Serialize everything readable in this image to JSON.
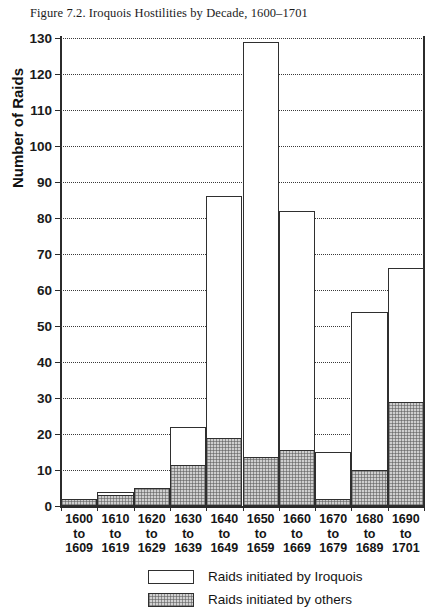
{
  "chart_data": {
    "type": "bar",
    "title": "Figure 7.2. Iroquois Hostilities by Decade, 1600–1701",
    "xlabel": "",
    "ylabel": "Number of Raids",
    "ylim": [
      0,
      130
    ],
    "ytick_step": 10,
    "grid": true,
    "stacked": true,
    "legend_position": "bottom",
    "categories": [
      "1600 to 1609",
      "1610 to 1619",
      "1620 to 1629",
      "1630 to 1639",
      "1640 to 1649",
      "1650 to 1659",
      "1660 to 1669",
      "1670 to 1679",
      "1680 to 1689",
      "1690 to 1701"
    ],
    "category_lines": [
      [
        "1600",
        "to",
        "1609"
      ],
      [
        "1610",
        "to",
        "1619"
      ],
      [
        "1620",
        "to",
        "1629"
      ],
      [
        "1630",
        "to",
        "1639"
      ],
      [
        "1640",
        "to",
        "1649"
      ],
      [
        "1650",
        "to",
        "1659"
      ],
      [
        "1660",
        "to",
        "1669"
      ],
      [
        "1670",
        "to",
        "1679"
      ],
      [
        "1680",
        "to",
        "1689"
      ],
      [
        "1690",
        "to",
        "1701"
      ]
    ],
    "yticks": [
      0,
      10,
      20,
      30,
      40,
      50,
      60,
      70,
      80,
      90,
      100,
      110,
      120,
      130
    ],
    "series": [
      {
        "name": "Raids initiated by Iroquois",
        "swatch": "open",
        "values": [
          0,
          1,
          0,
          10.5,
          67,
          115.5,
          66.5,
          13,
          44,
          37
        ]
      },
      {
        "name": "Raids initiated by others",
        "swatch": "shaded",
        "values": [
          2,
          3,
          5,
          11.5,
          19,
          13.5,
          15.5,
          2,
          10,
          29
        ]
      }
    ],
    "totals": [
      2,
      4,
      5,
      22,
      86,
      129,
      82,
      15,
      54,
      66
    ]
  },
  "legend": {
    "items": [
      {
        "label": "Raids initiated by Iroquois",
        "swatch": "open"
      },
      {
        "label": "Raids initiated by others",
        "swatch": "shaded"
      }
    ]
  },
  "colors": {
    "axis": "#2b2b2b",
    "grid": "#3a3a3a",
    "bar_open_fill": "#ffffff",
    "bar_shaded_fill": "#cfcfcf",
    "bar_stroke": "#2f2f2f",
    "text": "#1a1a1a",
    "background": "#ffffff"
  }
}
